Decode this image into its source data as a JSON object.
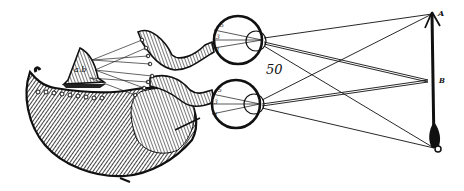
{
  "figure": {
    "plate_number": "50",
    "object_labels": {
      "top": "A",
      "middle": "B"
    },
    "brain_gland_label": "a.b",
    "eye_labels": {
      "upper": [
        "5",
        "3",
        "1"
      ],
      "lower": [
        "5",
        "3",
        "1"
      ]
    },
    "colors": {
      "ink": "#111111",
      "paper": "#ffffff",
      "shade": "#555555"
    }
  }
}
